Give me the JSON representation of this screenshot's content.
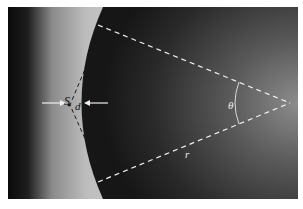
{
  "figure": {
    "labels": {
      "s": "S",
      "d": "d",
      "theta": "θ",
      "r": "r"
    },
    "colors": {
      "background_dark": "#141414",
      "bright_band": "#bdbdbd",
      "annotation_white": "#f0f0f0",
      "annotation_black": "#1a1a1a"
    }
  }
}
